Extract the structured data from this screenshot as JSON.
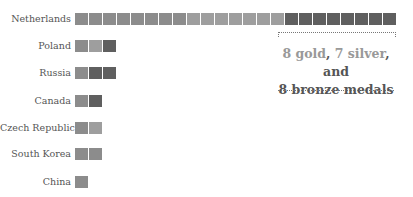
{
  "chart_data": {
    "type": "bar",
    "subtype": "stacked unit/waffle bar",
    "title": "",
    "xlabel": "",
    "ylabel": "",
    "categories": [
      "Netherlands",
      "Poland",
      "Russia",
      "Canada",
      "Czech Republic",
      "South Korea",
      "China"
    ],
    "series": [
      {
        "name": "gold",
        "color": "#8c8c8c",
        "values": [
          8,
          1,
          1,
          1,
          1,
          2,
          1
        ]
      },
      {
        "name": "silver",
        "color": "#9e9e9e",
        "values": [
          7,
          1,
          0,
          0,
          1,
          0,
          0
        ]
      },
      {
        "name": "bronze",
        "color": "#5f5f5f",
        "values": [
          8,
          1,
          2,
          1,
          0,
          0,
          0
        ]
      }
    ],
    "totals": [
      23,
      3,
      3,
      2,
      2,
      2,
      1
    ],
    "annotation": "8 gold, 7 silver, and 8 bronze medals",
    "grid": false,
    "legend": "none"
  },
  "annotation": {
    "gold": "8 gold",
    "sep1": ", ",
    "silver": "7 silver",
    "sep2": ", and",
    "line2": "8 bronze medals"
  }
}
